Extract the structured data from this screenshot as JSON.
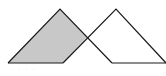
{
  "diagram": {
    "left_triangle": {
      "apex": [
        60,
        9
      ],
      "base_left": [
        8,
        63
      ],
      "base_right": [
        112,
        63
      ]
    },
    "right_triangle": {
      "apex": [
        116,
        9
      ],
      "base_left": [
        63,
        63
      ],
      "base_right": [
        166,
        63
      ]
    },
    "shaded_region": {
      "points": [
        [
          60,
          9
        ],
        [
          87,
          37
        ],
        [
          63,
          63
        ],
        [
          8,
          63
        ]
      ],
      "fill": "#c8c8c8"
    },
    "stroke_color": "#1a1a1a",
    "caption": "· · ·  ·"
  }
}
